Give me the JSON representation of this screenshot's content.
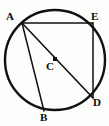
{
  "figure": {
    "background_color": "#fdfdfb",
    "stroke_color": "#111111",
    "label_color": "#0b0b0b"
  },
  "circle": {
    "name": "circle-outline",
    "center_x": 55,
    "center_y": 60,
    "radius": 50,
    "stroke_width": 2.4
  },
  "center_marker": {
    "name": "center-point-C",
    "x": 55,
    "y": 59,
    "size": 4,
    "shape": "square"
  },
  "points": [
    {
      "id": "A",
      "label": "A",
      "x": 22,
      "y": 23,
      "label_x": 6,
      "label_y": 11
    },
    {
      "id": "E",
      "label": "E",
      "x": 93,
      "y": 23,
      "label_x": 91,
      "label_y": 11
    },
    {
      "id": "D",
      "label": "D",
      "x": 93,
      "y": 98,
      "label_x": 93,
      "label_y": 97
    },
    {
      "id": "B",
      "label": "B",
      "x": 44,
      "y": 111,
      "label_x": 40,
      "label_y": 112
    },
    {
      "id": "C",
      "label": "C",
      "x": 55,
      "y": 59,
      "label_x": 46,
      "label_y": 61
    }
  ],
  "segments": [
    {
      "name": "segment-AE",
      "from": "A",
      "to": "E",
      "x1": 22,
      "y1": 23,
      "x2": 93,
      "y2": 23,
      "stroke_width": 1.5
    },
    {
      "name": "segment-ED",
      "from": "E",
      "to": "D",
      "x1": 93,
      "y1": 23,
      "x2": 93,
      "y2": 98,
      "stroke_width": 1.5
    },
    {
      "name": "segment-AD",
      "from": "A",
      "to": "D",
      "x1": 22,
      "y1": 23,
      "x2": 93,
      "y2": 98,
      "stroke_width": 1.6
    },
    {
      "name": "segment-AB",
      "from": "A",
      "to": "B",
      "x1": 22,
      "y1": 23,
      "x2": 44,
      "y2": 111,
      "stroke_width": 1.5
    }
  ]
}
